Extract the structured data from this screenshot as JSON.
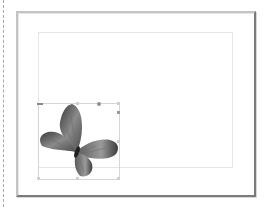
{
  "canvas": {
    "background": "#ffffff",
    "page_frame": {
      "border_light": "#c4c4c4",
      "border_dark": "#7a7a7a"
    },
    "margin_guide_color": "#e6e6e6",
    "left_guide": "dashed"
  },
  "selection": {
    "object": "butterfly-image",
    "handles": [
      "top-left",
      "top-center",
      "top-right",
      "middle-right",
      "bottom-left",
      "bottom-center",
      "bottom-right"
    ],
    "box_color": "#d6d6d6",
    "handle_color": "#9a9a9a"
  },
  "image": {
    "subject": "butterfly",
    "tone": "grayscale"
  }
}
